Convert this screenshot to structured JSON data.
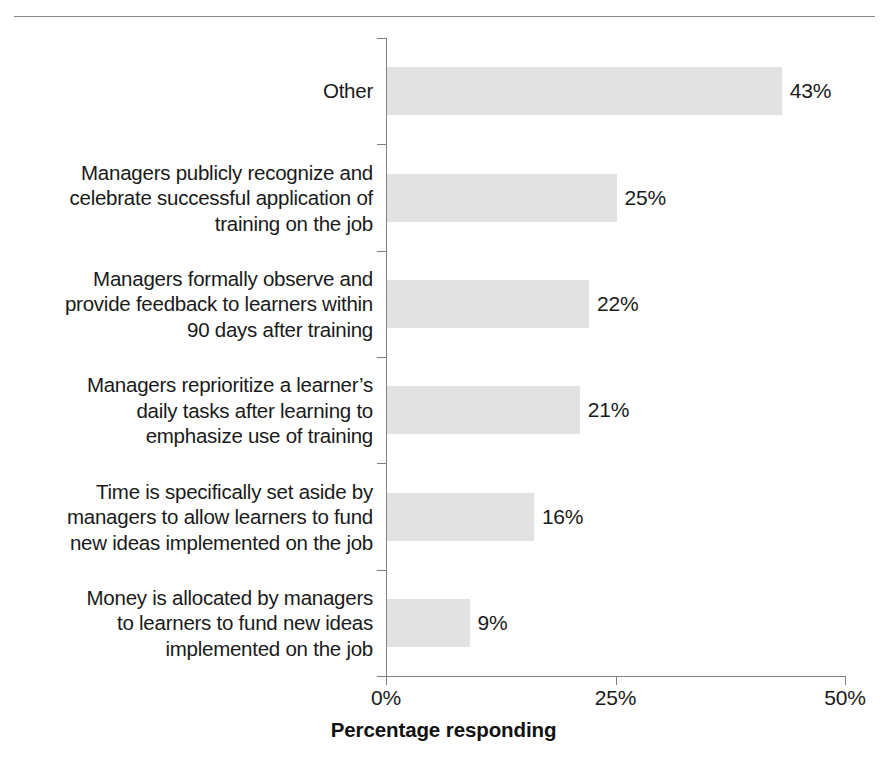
{
  "chart_data": {
    "type": "bar",
    "orientation": "horizontal",
    "title": "",
    "subtitle": "",
    "xlabel": "Percentage responding",
    "ylabel": "",
    "xlim": [
      0,
      50
    ],
    "xtick_labels": [
      "0%",
      "25%",
      "50%"
    ],
    "xtick_values": [
      0,
      25,
      50
    ],
    "grid": false,
    "legend": false,
    "bar_color": "#e2e2e2",
    "axis_color": "#808080",
    "text_color": "#1a1a1a",
    "categories": [
      "Other",
      "Managers publicly recognize and\ncelebrate successful application of\ntraining on the job",
      "Managers formally observe and\nprovide feedback to learners within\n90 days after training",
      "Managers reprioritize a learner’s\ndaily tasks after learning to\nemphasize use of training",
      "Time is specifically set aside by\nmanagers to allow learners to fund\nnew ideas implemented on the job",
      "Money is allocated by managers\nto learners to fund new ideas\nimplemented on the job"
    ],
    "values": [
      43,
      25,
      22,
      21,
      16,
      9
    ],
    "value_labels": [
      "43%",
      "25%",
      "22%",
      "21%",
      "16%",
      "9%"
    ]
  }
}
